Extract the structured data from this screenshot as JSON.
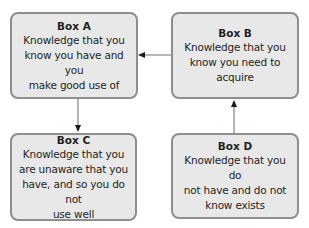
{
  "diagram": {
    "type": "flow",
    "boxes": [
      {
        "id": "A",
        "title": "Box A",
        "body_lines": [
          "Knowledge that you",
          "know you have and you",
          "make good use of"
        ]
      },
      {
        "id": "B",
        "title": "Box B",
        "body_lines": [
          "Knowledge that you",
          "know you need to",
          "acquire"
        ]
      },
      {
        "id": "C",
        "title": "Box C",
        "body_lines": [
          "Knowledge that you",
          "are unaware that you",
          "have, and so you do not",
          "use well"
        ]
      },
      {
        "id": "D",
        "title": "Box D",
        "body_lines": [
          "Knowledge that you do",
          "not have and do not",
          "know exists"
        ]
      }
    ],
    "arrows": [
      {
        "from": "B",
        "to": "A",
        "direction": "left"
      },
      {
        "from": "A",
        "to": "C",
        "direction": "down"
      },
      {
        "from": "D",
        "to": "B",
        "direction": "up"
      }
    ],
    "colors": {
      "box_fill": "#e8e8e8",
      "box_border": "#8e8e8e",
      "connector": "#8e8e8e",
      "arrowhead": "#1a1a1a",
      "text": "#1f1f1f"
    }
  }
}
